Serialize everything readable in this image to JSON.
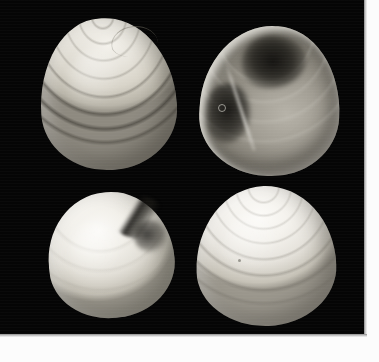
{
  "plate": {
    "width": 379,
    "height": 362,
    "background_color": "#ffffff",
    "photo_background_color": "#050505",
    "paper_margin_color": "#fcfcfc",
    "caption": "",
    "specimen_count": 4,
    "arrangement": "2x2 grid"
  },
  "specimens": [
    {
      "id": "top-left",
      "name": "bivalve-shell-exterior-left-valve",
      "position": "top-left",
      "view": "exterior",
      "surface": "strong concentric growth ribs",
      "tone": "pale cream white",
      "shadow_side": "lower right"
    },
    {
      "id": "top-right",
      "name": "bivalve-shell-interior-right-valve",
      "position": "top-right",
      "view": "interior",
      "surface": "smooth nacre with dark adductor muscle scars and pallial line",
      "tone": "grey with dark shadowed scars",
      "shadow_side": "upper centre and left flank"
    },
    {
      "id": "bottom-left",
      "name": "bivalve-shell-exterior-worn-valve",
      "position": "bottom-left",
      "view": "exterior",
      "surface": "smooth glossy, eroded margin notch on upper right shoulder",
      "tone": "bright white",
      "shadow_side": "upper right notch"
    },
    {
      "id": "bottom-right",
      "name": "bivalve-shell-exterior-right-valve",
      "position": "bottom-right",
      "view": "exterior",
      "surface": "fine concentric growth ribs",
      "tone": "bright white",
      "shadow_side": "lower right"
    }
  ]
}
